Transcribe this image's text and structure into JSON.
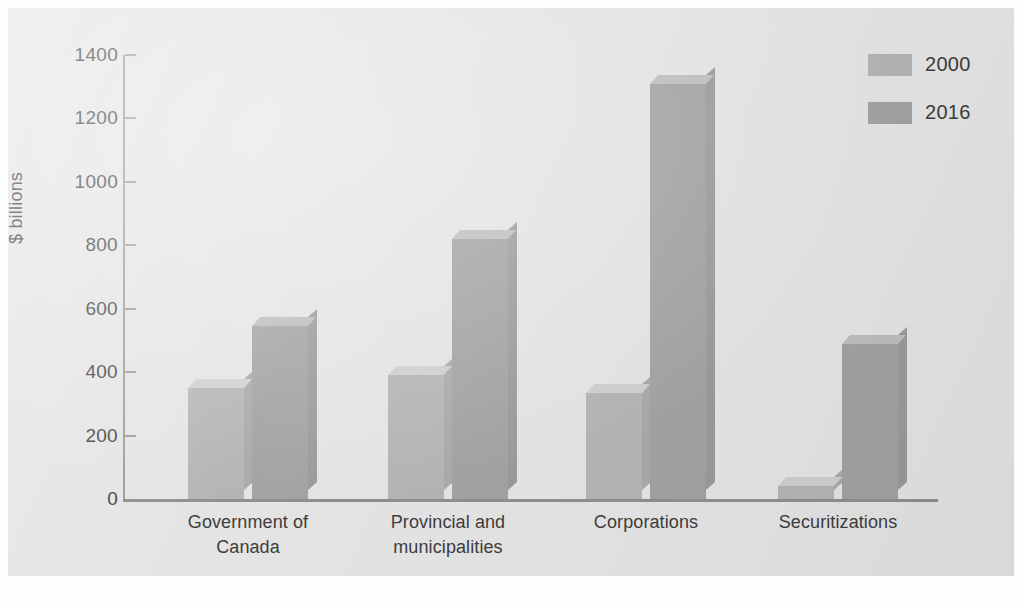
{
  "chart_data": {
    "type": "bar",
    "title": "",
    "xlabel": "",
    "ylabel": "$ billions",
    "ylim": [
      0,
      1400
    ],
    "yticks": [
      0,
      200,
      400,
      600,
      800,
      1000,
      1200,
      1400
    ],
    "ytick_labels": [
      "0",
      "200",
      "400",
      "600",
      "800",
      "1000",
      "1200",
      "1400"
    ],
    "grid": false,
    "legend_position": "top-right",
    "categories": [
      "Government of\nCanada",
      "Provincial and\nmunicipalities",
      "Corporations",
      "Securitizations"
    ],
    "category_lines": [
      [
        "Government of",
        "Canada"
      ],
      [
        "Provincial and",
        "municipalities"
      ],
      [
        "Corporations",
        ""
      ],
      [
        "Securitizations",
        ""
      ]
    ],
    "series": [
      {
        "name": "2000",
        "color": "#b4b4b4",
        "values": [
          350,
          390,
          335,
          40
        ]
      },
      {
        "name": "2016",
        "color": "#a2a2a2",
        "values": [
          545,
          820,
          1310,
          490
        ]
      }
    ]
  },
  "legend": {
    "items": [
      {
        "label": "2000",
        "color": "#b4b4b4"
      },
      {
        "label": "2016",
        "color": "#a2a2a2"
      }
    ]
  },
  "axes": {
    "y_axis_title": "$ billions",
    "y_tick_0": "0",
    "y_tick_1": "200",
    "y_tick_2": "400",
    "y_tick_3": "600",
    "y_tick_4": "800",
    "y_tick_5": "1000",
    "y_tick_6": "1200",
    "y_tick_7": "1400"
  },
  "colors": {
    "panel_background": "#e4e4e4",
    "page_background": "#fdfdfd",
    "axis": "#8f8f8f",
    "text": "#3d3d3d",
    "series_2000": "#b4b4b4",
    "series_2016": "#a2a2a2"
  }
}
